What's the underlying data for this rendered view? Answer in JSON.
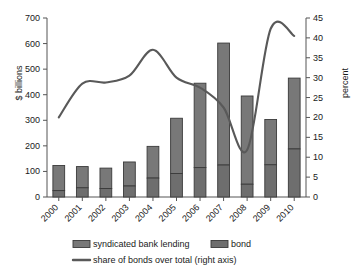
{
  "chart_data": {
    "type": "bar",
    "title": "",
    "subtitle": "",
    "xlabel": "",
    "ylabel": "$ billions",
    "y2label": "percent",
    "ylim": [
      0,
      700
    ],
    "y2lim": [
      0,
      45
    ],
    "grid": false,
    "legend_position": "bottom",
    "stacked": true,
    "categories": [
      "2000",
      "2001",
      "2002",
      "2003",
      "2004",
      "2005",
      "2006",
      "2007",
      "2008",
      "2009",
      "2010"
    ],
    "yticks": [
      0,
      100,
      200,
      300,
      400,
      500,
      600,
      700
    ],
    "y2ticks": [
      0,
      5,
      10,
      15,
      20,
      25,
      30,
      35,
      40,
      45
    ],
    "series": [
      {
        "name": "bond",
        "axis": "left",
        "type": "bar",
        "color": "#6e6e6e",
        "values": [
          25,
          36,
          33,
          43,
          74,
          92,
          115,
          125,
          50,
          126,
          188
        ]
      },
      {
        "name": "syndicated bank lending",
        "axis": "left",
        "type": "bar",
        "color": "#787878",
        "values": [
          98,
          83,
          80,
          94,
          124,
          216,
          330,
          477,
          345,
          177,
          277
        ]
      },
      {
        "name": "share of bonds over total (right axis)",
        "axis": "right",
        "type": "line",
        "color": "#595959",
        "values": [
          20.0,
          28.5,
          28.8,
          30.5,
          37.0,
          30.0,
          27.5,
          22.5,
          11.8,
          42.3,
          40.5
        ]
      }
    ],
    "totals": [
      123,
      119,
      113,
      137,
      198,
      308,
      445,
      602,
      395,
      303,
      465
    ]
  },
  "legend": {
    "items": [
      {
        "label": "syndicated bank lending",
        "marker": "bar-swatch"
      },
      {
        "label": "bond",
        "marker": "bar-swatch"
      },
      {
        "label": "share of bonds over total (right axis)",
        "marker": "line-swatch"
      }
    ]
  },
  "axes": {
    "left_title": "$ billions",
    "right_title": "percent"
  }
}
